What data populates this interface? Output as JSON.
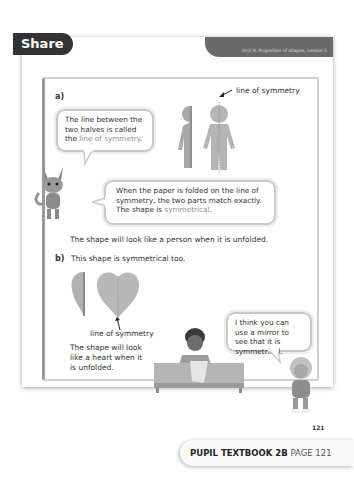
{
  "header": {
    "unit_label": "Unit 9: Properties of shapes, Lesson 5",
    "section_title": "Share"
  },
  "part_a": {
    "label": "a)",
    "figure_caption": "line of symmetry",
    "bubble1": {
      "text_before": "The line between the two halves is called the ",
      "highlight": "line of symmetry",
      "text_after": "."
    },
    "bubble2": {
      "text_before": "When the paper is folded on the line of symmetry, the two parts match exactly. The shape is ",
      "highlight": "symmetrical",
      "text_after": "."
    },
    "statement": "The shape will look like a person when it is unfolded."
  },
  "part_b": {
    "label": "b)",
    "intro": "This shape is symmetrical too.",
    "figure_caption": "line of symmetry",
    "statement": "The shape will look like a heart when it is unfolded.",
    "bubble": {
      "text": "I think you can use a mirror to see that it is symmetrical."
    }
  },
  "page_number": "121",
  "footer": {
    "book": "PUPIL TEXTBOOK 2B",
    "page": "PAGE 121"
  },
  "colors": {
    "tab_dark": "#333333",
    "highlight_text": "#8f8f8f",
    "figure_fill": "#b5b5b5"
  }
}
